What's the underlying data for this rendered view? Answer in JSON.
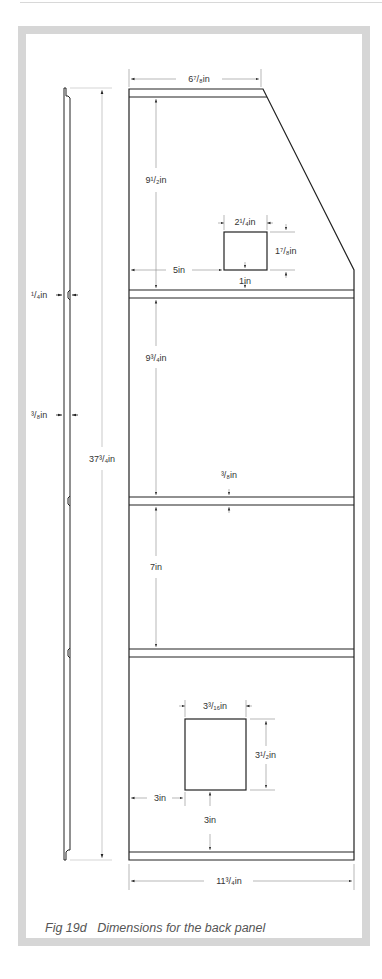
{
  "figure": {
    "caption_number": "Fig 19d",
    "caption_text": "Dimensions for the back panel"
  },
  "dimensions": {
    "top_width": "6⁷/₈in",
    "top_section_height": "9¹/₂in",
    "small_opening_width": "2¹/₄in",
    "small_opening_height": "1⁷/₈in",
    "small_opening_left_offset": "5in",
    "small_opening_bottom_offset": "1in",
    "groove_depth": "¹/₄in",
    "panel_thickness": "³/₈in",
    "overall_height": "37³/₄in",
    "middle_section_height": "9³/₄in",
    "rail_width": "³/₈in",
    "lower_section_height": "7in",
    "large_opening_width": "3³/₁₆in",
    "large_opening_height": "3¹/₂in",
    "large_opening_left_offset": "3in",
    "large_opening_bottom_offset": "3in",
    "overall_width": "11³/₄in"
  },
  "colors": {
    "frame": "#d6d6d6",
    "line": "#222222",
    "dim_line": "#999999"
  }
}
